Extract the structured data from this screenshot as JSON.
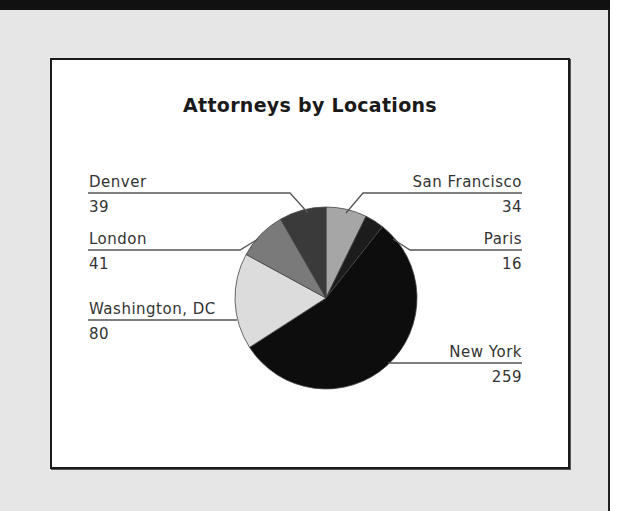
{
  "chart_data": {
    "type": "pie",
    "title": "Attorneys by Locations",
    "categories": [
      "San Francisco",
      "Paris",
      "New York",
      "Washington, DC",
      "London",
      "Denver"
    ],
    "values": [
      34,
      16,
      259,
      80,
      41,
      39
    ],
    "colors": [
      "#a6a6a6",
      "#1c1c1c",
      "#0d0d0d",
      "#dcdcdc",
      "#7a7a7a",
      "#3a3a3a"
    ],
    "start_angle": "12 o'clock, clockwise",
    "legend_position": "leader-line labels around pie"
  },
  "labels": {
    "denver": {
      "name": "Denver",
      "value": "39"
    },
    "london": {
      "name": "London",
      "value": "41"
    },
    "washington": {
      "name": "Washington, DC",
      "value": "80"
    },
    "san_francisco": {
      "name": "San Francisco",
      "value": "34"
    },
    "paris": {
      "name": "Paris",
      "value": "16"
    },
    "new_york": {
      "name": "New York",
      "value": "259"
    }
  }
}
